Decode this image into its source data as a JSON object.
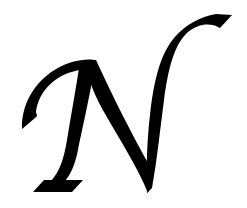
{
  "image": {
    "subject": "Calligraphic capital letter",
    "letter": "N",
    "background_color": "#ffffff",
    "glyph_color": "#000000"
  }
}
